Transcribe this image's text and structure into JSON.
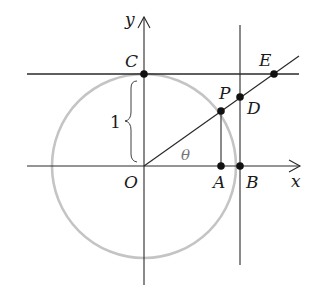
{
  "diagram": {
    "type": "unit-circle-trigonometry",
    "colors": {
      "line": "#2a2a2a",
      "circle": "#c4c4c4",
      "point": "#111111",
      "theta": "#777777"
    },
    "axes": {
      "x_label": "x",
      "y_label": "y"
    },
    "points": {
      "O": {
        "label": "O"
      },
      "A": {
        "label": "A"
      },
      "B": {
        "label": "B"
      },
      "C": {
        "label": "C"
      },
      "P": {
        "label": "P"
      },
      "D": {
        "label": "D"
      },
      "E": {
        "label": "E"
      }
    },
    "angle_label": "θ",
    "radius_label": "1"
  }
}
